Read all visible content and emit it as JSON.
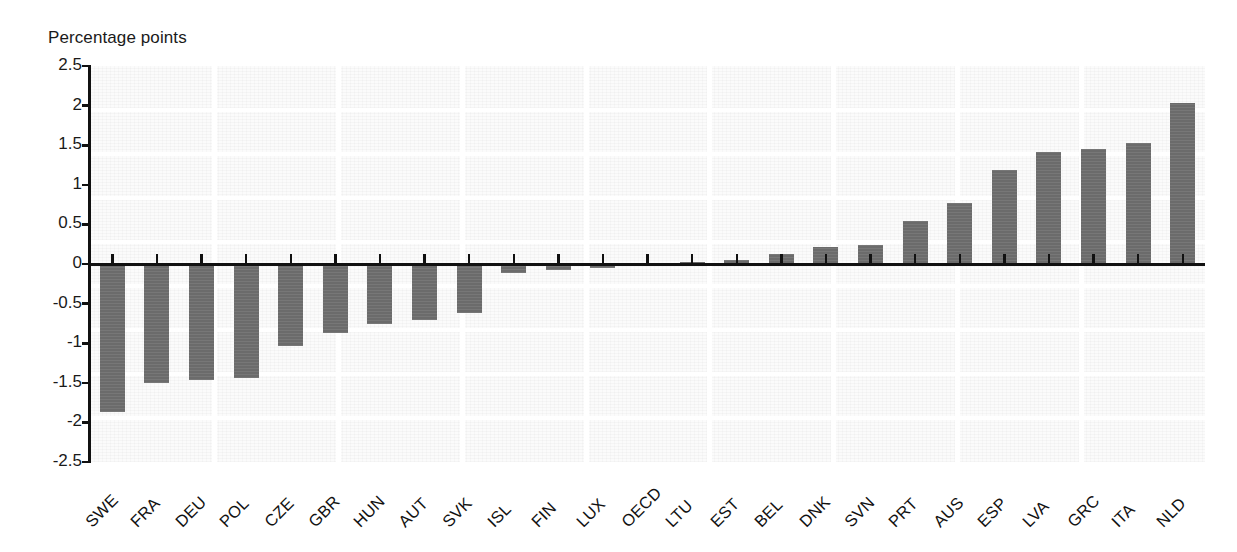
{
  "chart_data": {
    "type": "bar",
    "title": "",
    "subtitle": "",
    "ylabel": "Percentage points",
    "xlabel": "",
    "ylim": [
      -2.5,
      2.5
    ],
    "ytick_labels": [
      "2.5",
      "2",
      "1.5",
      "1",
      "0.5",
      "0",
      "-0.5",
      "-1",
      "-1.5",
      "-2",
      "-2.5"
    ],
    "ytick_values": [
      2.5,
      2,
      1.5,
      1,
      0.5,
      0,
      -0.5,
      -1,
      -1.5,
      -2,
      -2.5
    ],
    "grid": false,
    "legend": "none",
    "bar_color": "#6f6f6f",
    "axis_color": "#111111",
    "background_color": "#fbfbfb",
    "categories": [
      "SWE",
      "FRA",
      "DEU",
      "POL",
      "CZE",
      "GBR",
      "HUN",
      "AUT",
      "SVK",
      "ISL",
      "FIN",
      "LUX",
      "OECD",
      "LTU",
      "EST",
      "BEL",
      "DNK",
      "SVN",
      "PRT",
      "AUS",
      "ESP",
      "LVA",
      "GRC",
      "ITA",
      "NLD"
    ],
    "values": [
      -1.87,
      -1.5,
      -1.47,
      -1.44,
      -1.04,
      -0.87,
      -0.76,
      -0.71,
      -0.62,
      -0.11,
      -0.08,
      -0.05,
      -0.01,
      0.03,
      0.05,
      0.13,
      0.22,
      0.24,
      0.54,
      0.77,
      1.19,
      1.41,
      1.45,
      1.53,
      2.03
    ]
  },
  "axis": {
    "y_title": "Percentage points"
  }
}
